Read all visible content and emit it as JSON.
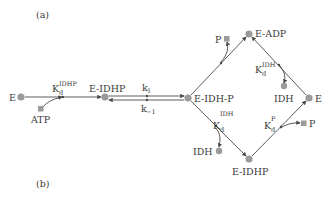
{
  "panels": {
    "a_label": "(a)",
    "b_label": "(b)"
  },
  "colors": {
    "node_fill": "#9a9a9a",
    "line": "#4a4a4a",
    "text": "#3a3a3a",
    "background": "#ffffff"
  },
  "nodes": {
    "e_left": "E",
    "e_idhp_left": "E-IDHP",
    "e_idh_p": "E-IDH-P",
    "e_adp": "E-ADP",
    "e_right": "E",
    "e_idhp_bottom": "E-IDHP",
    "atp": "ATP",
    "p_top": "P",
    "idh_top": "IDH",
    "idh_bottom": "IDH",
    "p_right": "P"
  },
  "constants": {
    "kd_idhp": {
      "base": "K",
      "sub": "d",
      "sup": "IDHP"
    },
    "k1": {
      "base": "k",
      "sub": "1"
    },
    "k_minus1": {
      "base": "k",
      "sub": "−1"
    },
    "kd_idh_top": {
      "base": "K",
      "sub": "d",
      "sup": "IDH"
    },
    "kd_idh_bottom": {
      "base": "K",
      "sub": "d",
      "sup": "IDH"
    },
    "kd_p": {
      "base": "K",
      "sub": "d",
      "sup": "P"
    }
  }
}
